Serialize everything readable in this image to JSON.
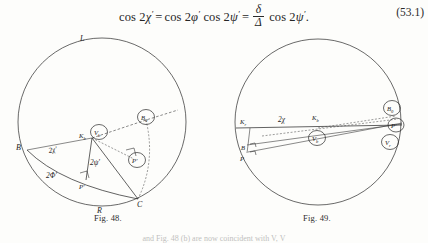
{
  "equation": {
    "number": "(53.1)",
    "plain": "cos 2χ′ = cos 2φ′ cos 2ψ′ = δ/Δ cos 2ψ′.",
    "lhs_fn": "cos",
    "lhs_arg_num": "2",
    "lhs_var": "χ",
    "lhs_prime": "′",
    "eq1": "=",
    "t2_fn": "cos",
    "t2_num": "2",
    "t2_var": "φ",
    "t2_prime": "′",
    "t3_fn": "cos",
    "t3_num": "2",
    "t3_var": "ψ",
    "t3_prime": "′",
    "eq2": "=",
    "frac_num": "δ",
    "frac_den": "Δ",
    "t4_fn": "cos",
    "t4_num": "2",
    "t4_var": "ψ",
    "t4_prime": "′",
    "period": "."
  },
  "figure48": {
    "caption": "Fig. 48.",
    "labels": {
      "top": "L",
      "bottom": "R",
      "left_point": "B",
      "angle_chi": "2χ′",
      "angle_psi": "2ψ′",
      "angle_phi": "2Φ′",
      "apex_plain": "K",
      "apex_sub": "b",
      "apex_circled": "V",
      "apex_circled_sub": "b",
      "circled_b0": "B",
      "circled_b0_sub": "0",
      "circled_pprime": "P′",
      "foot_pprime": "P′",
      "vertex_c": "C"
    }
  },
  "figure49": {
    "caption": "Fig. 49.",
    "labels": {
      "left_k": "K",
      "left_k_sub": "r",
      "angle_chi": "2χ",
      "center_k": "K",
      "center_k_sub": "b",
      "center_circled": "V",
      "center_circled_sub": "b",
      "left_b": "B",
      "left_p": "P",
      "circled_b0": "B",
      "circled_b0_sub": "0",
      "circled_pprime": "P′",
      "circled_vr": "V",
      "circled_vr_sub": "r"
    }
  },
  "footer": {
    "partial_line": "and Fig. 48 (b) are now coincident with V, V"
  }
}
